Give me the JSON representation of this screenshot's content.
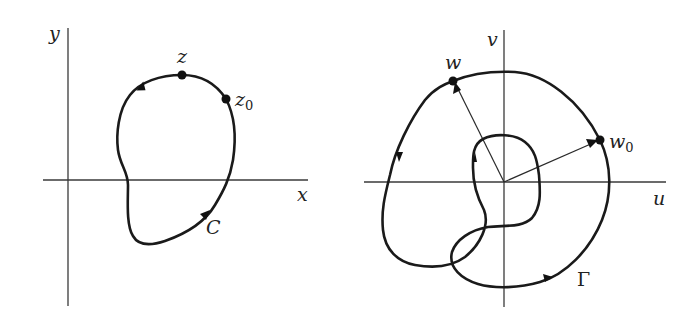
{
  "diagram": {
    "left_panel": {
      "axes": {
        "horizontal_label": "x",
        "vertical_label": "y"
      },
      "curve_label": "C",
      "points": [
        {
          "name": "z",
          "label": "z",
          "subscript": ""
        },
        {
          "name": "z0",
          "label": "z",
          "subscript": "0"
        }
      ],
      "orientation": "counterclockwise"
    },
    "right_panel": {
      "axes": {
        "horizontal_label": "u",
        "vertical_label": "v"
      },
      "curve_label": "Γ",
      "points": [
        {
          "name": "w",
          "label": "w",
          "subscript": ""
        },
        {
          "name": "w0",
          "label": "w",
          "subscript": "0"
        }
      ],
      "vectors": [
        "origin-to-w",
        "origin-to-w0"
      ],
      "orientation": "counterclockwise, winds around origin twice"
    },
    "colors": {
      "background": "#ffffff",
      "ink": "#1a1a1a",
      "axis": "#3a3a3a"
    }
  }
}
